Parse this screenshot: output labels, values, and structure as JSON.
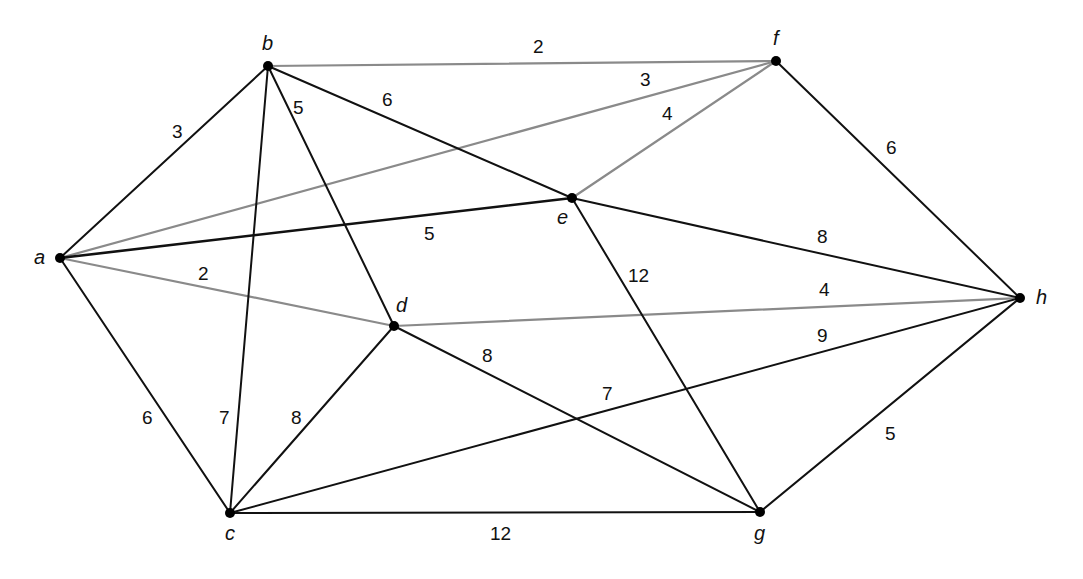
{
  "diagram": {
    "type": "weighted-undirected-graph",
    "colors": {
      "black_edge": "#111111",
      "gray_edge": "#8a8a8a",
      "node": "#000000"
    },
    "nodes": [
      {
        "id": "a",
        "label": "a",
        "x": 60,
        "y": 258,
        "lx": 34,
        "ly": 264
      },
      {
        "id": "b",
        "label": "b",
        "x": 268,
        "y": 66,
        "lx": 262,
        "ly": 50
      },
      {
        "id": "c",
        "label": "c",
        "x": 230,
        "y": 513,
        "lx": 225,
        "ly": 540
      },
      {
        "id": "d",
        "label": "d",
        "x": 394,
        "y": 326,
        "lx": 396,
        "ly": 312
      },
      {
        "id": "e",
        "label": "e",
        "x": 572,
        "y": 198,
        "lx": 557,
        "ly": 224
      },
      {
        "id": "f",
        "label": "f",
        "x": 776,
        "y": 61,
        "lx": 773,
        "ly": 45
      },
      {
        "id": "g",
        "label": "g",
        "x": 760,
        "y": 512,
        "lx": 754,
        "ly": 540
      },
      {
        "id": "h",
        "label": "h",
        "x": 1020,
        "y": 298,
        "lx": 1036,
        "ly": 304
      }
    ],
    "edges": [
      {
        "from": "a",
        "to": "b",
        "weight": "3",
        "color": "black",
        "lx": 172,
        "ly": 138
      },
      {
        "from": "a",
        "to": "f",
        "weight": "3",
        "color": "gray",
        "lx": 640,
        "ly": 86
      },
      {
        "from": "a",
        "to": "e",
        "weight": "5",
        "color": "black",
        "width": 2.6,
        "lx": 424,
        "ly": 240
      },
      {
        "from": "a",
        "to": "d",
        "weight": "2",
        "color": "gray",
        "lx": 198,
        "ly": 280
      },
      {
        "from": "a",
        "to": "c",
        "weight": "6",
        "color": "black",
        "lx": 142,
        "ly": 424
      },
      {
        "from": "b",
        "to": "f",
        "weight": "2",
        "color": "gray",
        "lx": 533,
        "ly": 53
      },
      {
        "from": "b",
        "to": "e",
        "weight": "6",
        "color": "black",
        "lx": 382,
        "ly": 106
      },
      {
        "from": "b",
        "to": "d",
        "weight": "5",
        "color": "black",
        "lx": 293,
        "ly": 114
      },
      {
        "from": "b",
        "to": "c",
        "weight": "7",
        "color": "black",
        "lx": 219,
        "ly": 424
      },
      {
        "from": "e",
        "to": "f",
        "weight": "4",
        "color": "gray",
        "lx": 662,
        "ly": 120
      },
      {
        "from": "e",
        "to": "h",
        "weight": "8",
        "color": "black",
        "lx": 817,
        "ly": 243
      },
      {
        "from": "e",
        "to": "g",
        "weight": "12",
        "color": "black",
        "lx": 628,
        "ly": 282
      },
      {
        "from": "f",
        "to": "h",
        "weight": "6",
        "color": "black",
        "lx": 886,
        "ly": 154
      },
      {
        "from": "d",
        "to": "h",
        "weight": "4",
        "color": "gray",
        "lx": 819,
        "ly": 296
      },
      {
        "from": "c",
        "to": "d",
        "weight": "8",
        "color": "black",
        "lx": 291,
        "ly": 424
      },
      {
        "from": "d",
        "to": "g",
        "weight": "8",
        "color": "black",
        "lx": 482,
        "ly": 362
      },
      {
        "from": "c",
        "to": "h",
        "weight": "9",
        "color": "black",
        "lx": 817,
        "ly": 342,
        "note": "c-h carries two labels (7 and 9); which is the edge weight is ambiguous from the image"
      },
      {
        "from": "c",
        "to": "g",
        "weight": "12",
        "color": "black",
        "lx": 490,
        "ly": 540
      },
      {
        "from": "g",
        "to": "h",
        "weight": "5",
        "color": "black",
        "lx": 885,
        "ly": 440
      }
    ],
    "extra_labels": [
      {
        "text": "7",
        "lx": 602,
        "ly": 400,
        "note": "drawn on c-h near the d-g crossing; may be c-h's true weight instead of 9"
      }
    ]
  }
}
